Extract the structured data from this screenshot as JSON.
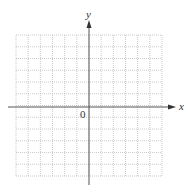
{
  "diagram": {
    "type": "coordinate-grid",
    "x_axis_label": "x",
    "y_axis_label": "y",
    "origin_label": "0",
    "grid": {
      "columns": 12,
      "rows": 12,
      "left": 16,
      "top": 35,
      "right": 162,
      "bottom": 176,
      "style": "dotted",
      "color": "#bdbdbd"
    },
    "axis_color": "#555555"
  }
}
